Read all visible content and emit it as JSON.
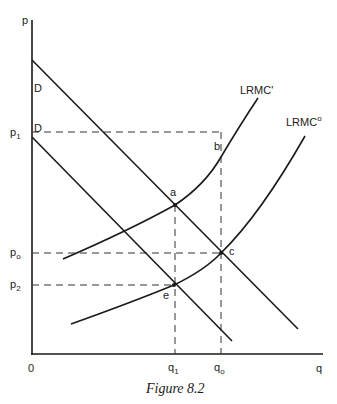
{
  "figure": {
    "caption": "Figure 8.2",
    "axes": {
      "y_label": "p",
      "x_label": "q",
      "origin_label": "0"
    },
    "curves": {
      "demand_upper_label": "D",
      "demand_lower_label": "D",
      "lrmc_prime_label": "LRMC'",
      "lrmc_zero_label": "LRMC",
      "lrmc_zero_superscript": "o"
    },
    "points": {
      "a": "a",
      "b": "b",
      "c": "c",
      "e": "e"
    },
    "price_ticks": [
      {
        "base": "p",
        "sub": "1"
      },
      {
        "base": "p",
        "sub": "o"
      },
      {
        "base": "p",
        "sub": "2"
      }
    ],
    "quantity_ticks": [
      {
        "base": "q",
        "sub": "1"
      },
      {
        "base": "q",
        "sub": "o"
      }
    ]
  },
  "colors": {
    "ink": "#1a1a1a",
    "background": "#ffffff"
  }
}
